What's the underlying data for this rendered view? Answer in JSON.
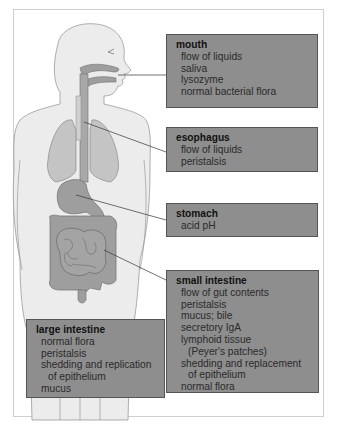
{
  "figure": {
    "boxes": {
      "mouth": {
        "title": "mouth",
        "items": [
          "flow of liquids",
          "saliva",
          "lysozyme",
          "normal bacterial flora"
        ]
      },
      "esophagus": {
        "title": "esophagus",
        "items": [
          "flow of liquids",
          "peristalsis"
        ]
      },
      "stomach": {
        "title": "stomach",
        "items": [
          "acid pH"
        ]
      },
      "small_intestine": {
        "title": "small intestine",
        "items": [
          "flow of gut contents",
          "peristalsis",
          "mucus; bile",
          "secretory IgA",
          "lymphoid tissue",
          "(Peyer's patches)",
          "shedding and replacement",
          "of epithelium",
          "normal flora"
        ]
      },
      "large_intestine": {
        "title": "large intestine",
        "items": [
          "normal flora",
          "peristalsis",
          "shedding and replication",
          "of epithelium",
          "mucus"
        ]
      }
    },
    "colors": {
      "box_fill": "#8e8e8e",
      "box_border": "#555555",
      "organ_fill": "#9e9e9e",
      "body_fill": "#ececec",
      "lung_fill": "#c4c4c4"
    }
  }
}
